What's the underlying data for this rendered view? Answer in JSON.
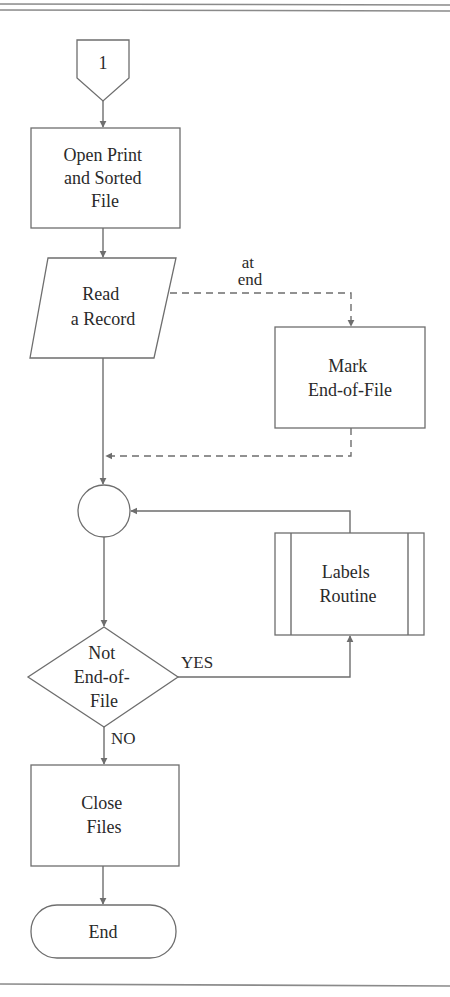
{
  "diagram": {
    "type": "flowchart",
    "connector": {
      "label": "1"
    },
    "nodes": [
      {
        "id": "open",
        "shape": "process",
        "lines": [
          "Open Print",
          "and Sorted",
          "File"
        ]
      },
      {
        "id": "read",
        "shape": "input-output",
        "lines": [
          "Read",
          "a Record"
        ]
      },
      {
        "id": "mark",
        "shape": "process",
        "lines": [
          "Mark",
          "End-of-File"
        ]
      },
      {
        "id": "junction",
        "shape": "connector-circle",
        "lines": []
      },
      {
        "id": "decision",
        "shape": "decision",
        "lines": [
          "Not",
          "End-of-",
          "File"
        ]
      },
      {
        "id": "labels",
        "shape": "predefined-process",
        "lines": [
          "Labels",
          "Routine"
        ]
      },
      {
        "id": "close",
        "shape": "process",
        "lines": [
          "Close",
          "Files"
        ]
      },
      {
        "id": "end",
        "shape": "terminator",
        "lines": [
          "End"
        ]
      }
    ],
    "edges": [
      {
        "from": "connector-1",
        "to": "open",
        "style": "solid"
      },
      {
        "from": "open",
        "to": "read",
        "style": "solid"
      },
      {
        "from": "read",
        "to": "mark",
        "style": "dashed",
        "label": "at end"
      },
      {
        "from": "mark",
        "to": "junction",
        "style": "dashed"
      },
      {
        "from": "read",
        "to": "junction",
        "style": "solid"
      },
      {
        "from": "junction",
        "to": "decision",
        "style": "solid"
      },
      {
        "from": "decision",
        "to": "labels",
        "style": "solid",
        "label": "YES"
      },
      {
        "from": "labels",
        "to": "junction",
        "style": "solid"
      },
      {
        "from": "decision",
        "to": "close",
        "style": "solid",
        "label": "NO"
      },
      {
        "from": "close",
        "to": "end",
        "style": "solid"
      }
    ],
    "edge_labels": {
      "at_end_line1": "at",
      "at_end_line2": "end",
      "yes": "YES",
      "no": "NO"
    },
    "colors": {
      "line": "#6e6e6e",
      "text": "#2a2a2a",
      "rule": "#8a8a8a",
      "background": "#ffffff"
    }
  }
}
